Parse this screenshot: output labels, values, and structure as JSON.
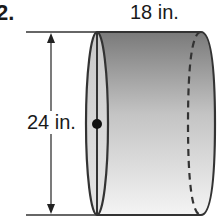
{
  "problem": {
    "number": "2."
  },
  "figure": {
    "shape": "cylinder",
    "orientation": "horizontal",
    "width_label": "18 in.",
    "height_label": "24 in.",
    "colors": {
      "outline": "#333333",
      "fill_dark": "#7a7a7a",
      "fill_light": "#f2f2f2",
      "face_fill": "#d6d6d6",
      "text": "#1a1a1a"
    }
  }
}
